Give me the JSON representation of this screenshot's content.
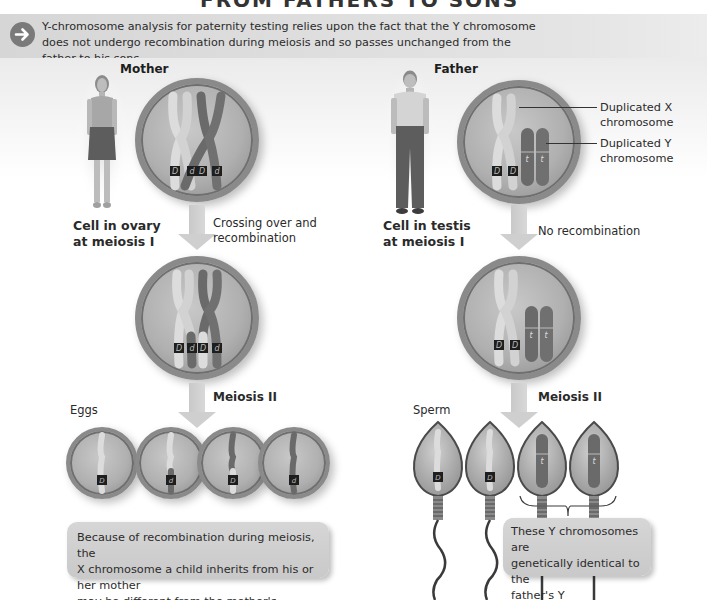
{
  "title": "FROM FATHERS TO SONS",
  "banner": {
    "icon": "arrow-right-circle-icon",
    "text": "Y-chromosome analysis for paternity testing relies upon the fact that the Y chromosome does not undergo recombination during meiosis and so passes unchanged from the father to his sons."
  },
  "mother": {
    "heading": "Mother",
    "cell_label": "Cell in ovary at meiosis I",
    "cell_label_line1": "Cell in ovary",
    "cell_label_line2": "at meiosis I",
    "step1_label_line1": "Crossing over and",
    "step1_label_line2": "recombination",
    "step2_label": "Meiosis II",
    "gametes_label": "Eggs",
    "meiosis1_alleles": [
      "D",
      "d",
      "D",
      "d"
    ],
    "after_crossover_alleles": [
      "D",
      "d",
      "D",
      "d"
    ],
    "egg_alleles": [
      "D",
      "d",
      "D",
      "d"
    ],
    "callout_line1": "Because of recombination during meiosis, the",
    "callout_line2": "X chromosome a child inherits from his or her mother",
    "callout_line3": "may be different from the mother's chromosome."
  },
  "father": {
    "heading": "Father",
    "cell_label_line1": "Cell in testis",
    "cell_label_line2": "at meiosis I",
    "step1_label": "No recombination",
    "step2_label": "Meiosis II",
    "gametes_label": "Sperm",
    "x_alleles": [
      "D",
      "D"
    ],
    "y_alleles": [
      "t",
      "t"
    ],
    "sperm_alleles": [
      "D",
      "D",
      "t",
      "t"
    ],
    "annotation_x_line1": "Duplicated X",
    "annotation_x_line2": "chromosome",
    "annotation_y_line1": "Duplicated Y",
    "annotation_y_line2": "chromosome",
    "callout_line1": "These Y chromosomes are",
    "callout_line2": "genetically identical to the",
    "callout_line3": "father's Y chromosome."
  },
  "colors": {
    "banner_bg": "#dcdcdc",
    "icon_bg": "#7a7a7a",
    "cell_fill": "#b5b5b5",
    "cell_border": "#8a8a8a",
    "light_chromosome": "#d9d9d9",
    "dark_chromosome": "#6d6d6d",
    "arrow": "#cfcfcf",
    "callout_bg": "#d0d0d0"
  }
}
